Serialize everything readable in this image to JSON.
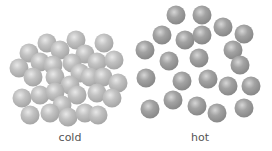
{
  "labels": {
    "cold": "cold",
    "hot": "hot"
  },
  "colors": {
    "cold_sphere": "#b9b9b9",
    "hot_sphere": "#9c9c9c",
    "label_text": "#555555",
    "background": "#ffffff"
  },
  "sphere_radius": 9.5,
  "cold_spheres": [
    [
      47,
      43
    ],
    [
      76,
      40
    ],
    [
      104,
      43
    ],
    [
      29,
      53
    ],
    [
      60,
      50
    ],
    [
      85,
      54
    ],
    [
      40,
      62
    ],
    [
      19,
      68
    ],
    [
      53,
      65
    ],
    [
      72,
      63
    ],
    [
      97,
      62
    ],
    [
      114,
      60
    ],
    [
      33,
      77
    ],
    [
      55,
      77
    ],
    [
      80,
      73
    ],
    [
      90,
      77
    ],
    [
      103,
      77
    ],
    [
      118,
      83
    ],
    [
      70,
      85
    ],
    [
      22,
      98
    ],
    [
      40,
      95
    ],
    [
      55,
      92
    ],
    [
      77,
      95
    ],
    [
      97,
      93
    ],
    [
      112,
      98
    ],
    [
      62,
      105
    ],
    [
      30,
      115
    ],
    [
      50,
      113
    ],
    [
      68,
      117
    ],
    [
      85,
      113
    ],
    [
      98,
      115
    ]
  ],
  "hot_spheres": [
    [
      176,
      15
    ],
    [
      202,
      15
    ],
    [
      223,
      27
    ],
    [
      244,
      34
    ],
    [
      162,
      35
    ],
    [
      185,
      40
    ],
    [
      202,
      35
    ],
    [
      145,
      50
    ],
    [
      233,
      50
    ],
    [
      169,
      61
    ],
    [
      199,
      58
    ],
    [
      240,
      65
    ],
    [
      146,
      78
    ],
    [
      182,
      81
    ],
    [
      208,
      79
    ],
    [
      228,
      86
    ],
    [
      251,
      86
    ],
    [
      150,
      109
    ],
    [
      173,
      100
    ],
    [
      197,
      106
    ],
    [
      217,
      113
    ],
    [
      244,
      108
    ]
  ]
}
